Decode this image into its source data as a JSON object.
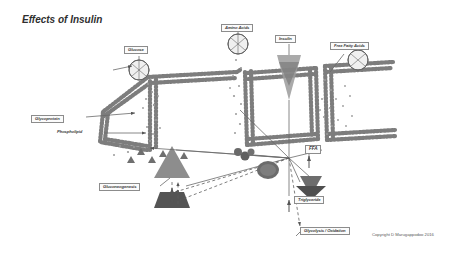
{
  "page": {
    "title": "Effects of Insulin",
    "copyright": "Copyright D Marugappodoo 2016",
    "background_color": "#ffffff",
    "ink_color": "#4a4a4a",
    "accent_fill": "#8f8f8f"
  },
  "labels": [
    {
      "id": "glucose",
      "text": "Glucose",
      "x": 124,
      "y": 46,
      "size": 4.2,
      "boxed": true
    },
    {
      "id": "amino-acids",
      "text": "Amino Acids",
      "x": 221,
      "y": 24,
      "size": 4.2,
      "boxed": true
    },
    {
      "id": "insulin",
      "text": "Insulin",
      "x": 275,
      "y": 35,
      "size": 4.2,
      "boxed": true
    },
    {
      "id": "free-fatty-acids",
      "text": "Free Fatty Acids",
      "x": 330,
      "y": 42,
      "size": 4.2,
      "boxed": true
    },
    {
      "id": "glycoprotein",
      "text": "Glycoprotein",
      "x": 31,
      "y": 115,
      "size": 4.2,
      "boxed": true
    },
    {
      "id": "phospholipid",
      "text": "Phospholipid",
      "x": 57,
      "y": 131,
      "size": 4.2,
      "boxed": false
    },
    {
      "id": "gluconeogenesis",
      "text": "Gluconeogenesis",
      "x": 99,
      "y": 183,
      "size": 4.2,
      "boxed": true
    },
    {
      "id": "ffa",
      "text": "FFA",
      "x": 309,
      "y": 147,
      "size": 4.6,
      "boxed": true
    },
    {
      "id": "triglyceride",
      "text": "Triglyceride",
      "x": 296,
      "y": 196,
      "size": 4.2,
      "boxed": true
    },
    {
      "id": "glycolysis-oxidation",
      "text": "Glycolysis / Oxidation",
      "x": 300,
      "y": 228,
      "size": 4.2,
      "boxed": true
    }
  ]
}
